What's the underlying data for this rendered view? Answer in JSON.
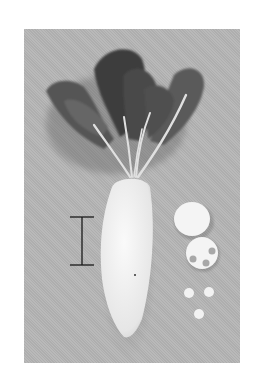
{
  "image": {
    "description": "Grayscale photograph of a daikon radish with leafy top, scale bar at left, and cut slices at right",
    "colors": {
      "background": "#b5b5b5",
      "radish": "#f2f2f2",
      "leaves": "#4a4a4a",
      "scale_bar": "#1a1a1a",
      "frame": "#ffffff"
    },
    "objects": [
      {
        "name": "daikon-root"
      },
      {
        "name": "leafy-top"
      },
      {
        "name": "scale-bar"
      },
      {
        "name": "whole-slice"
      },
      {
        "name": "slice-with-holes",
        "holes": 3
      },
      {
        "name": "small-discs",
        "count": 3
      }
    ]
  }
}
